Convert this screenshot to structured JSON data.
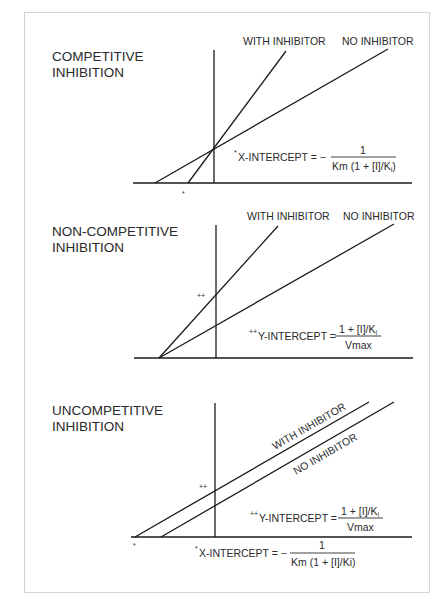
{
  "figure": {
    "panels": [
      {
        "title_line1": "COMPETITIVE",
        "title_line2": "INHIBITION",
        "labels": {
          "with_inhibitor": "WITH INHIBITOR",
          "no_inhibitor": "NO INHIBITOR"
        },
        "marker_x": "*",
        "formula": {
          "prefix_mark": "*",
          "lhs": "X-INTERCEPT = −",
          "numerator": "1",
          "denominator": "Km (1 + [I]/K",
          "denominator_sub": "i",
          "denominator_close": ")"
        }
      },
      {
        "title_line1": "NON-COMPETITIVE",
        "title_line2": "INHIBITION",
        "labels": {
          "with_inhibitor": "WITH INHIBITOR",
          "no_inhibitor": "NO INHIBITOR"
        },
        "marker_y": "++",
        "formula": {
          "prefix_mark": "++",
          "lhs": "Y-INTERCEPT =",
          "numerator": "1 + [I]/K",
          "numerator_sub": "i",
          "denominator": "Vmax"
        }
      },
      {
        "title_line1": "UNCOMPETITIVE",
        "title_line2": "INHIBITION",
        "labels": {
          "with_inhibitor": "WITH INHIBITOR",
          "no_inhibitor": "NO INHIBITOR"
        },
        "marker_x": "*",
        "marker_y": "++",
        "formula_y": {
          "prefix_mark": "++",
          "lhs": "Y-INTERCEPT =",
          "numerator": "1 + [I]/K",
          "numerator_sub": "i",
          "denominator": "Vmax"
        },
        "formula_x": {
          "prefix_mark": "*",
          "lhs": "X-INTERCEPT = −",
          "numerator": "1",
          "denominator": "Km (1 + [I]/Ki)"
        }
      }
    ]
  }
}
